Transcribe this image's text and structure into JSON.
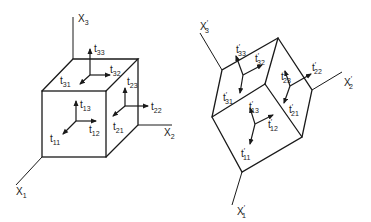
{
  "figure": {
    "left": {
      "axes": {
        "x1": "X",
        "x1_sub": "1",
        "x2": "X",
        "x2_sub": "2",
        "x3": "X",
        "x3_sub": "3"
      },
      "stress": {
        "t11": {
          "base": "t",
          "sub": "11"
        },
        "t12": {
          "base": "t",
          "sub": "12"
        },
        "t13": {
          "base": "t",
          "sub": "13"
        },
        "t21": {
          "base": "t",
          "sub": "21"
        },
        "t22": {
          "base": "t",
          "sub": "22"
        },
        "t23": {
          "base": "t",
          "sub": "23"
        },
        "t31": {
          "base": "t",
          "sub": "31"
        },
        "t32": {
          "base": "t",
          "sub": "32"
        },
        "t33": {
          "base": "t",
          "sub": "33"
        }
      }
    },
    "right": {
      "prime": "′",
      "axes": {
        "x1": "X",
        "x1_sub": "1",
        "x2": "X",
        "x2_sub": "2",
        "x3": "X",
        "x3_sub": "3"
      },
      "stress": {
        "t11": {
          "base": "t",
          "sub": "11"
        },
        "t12": {
          "base": "t",
          "sub": "12"
        },
        "t13": {
          "base": "t",
          "sub": "13"
        },
        "t21": {
          "base": "t",
          "sub": "21"
        },
        "t22": {
          "base": "t",
          "sub": "22"
        },
        "t23": {
          "base": "t",
          "sub": "23"
        },
        "t31": {
          "base": "t",
          "sub": "31"
        },
        "t32": {
          "base": "t",
          "sub": "32"
        },
        "t33": {
          "base": "t",
          "sub": "33"
        }
      }
    }
  }
}
